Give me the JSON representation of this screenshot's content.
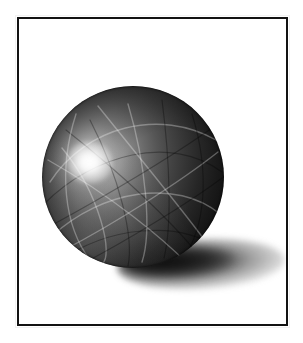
{
  "artwork": {
    "title": "Shaded sphere illustration",
    "subject": "sphere",
    "medium": "grayscale airbrush / digital render",
    "background_color": "#ffffff",
    "canvas": {
      "width": 303,
      "height": 343
    }
  },
  "frame": {
    "name": "rectangular border",
    "color": "#121212",
    "thickness_px": 2,
    "x": 17,
    "y": 17,
    "width": 271,
    "height": 309,
    "fill": "#ffffff"
  },
  "sphere": {
    "label": "sphere",
    "center_x": 133,
    "center_y": 177,
    "radius": 91,
    "highlight_x": 80,
    "highlight_y": 155,
    "highlight_color": "#ffffff",
    "midtone_color": "#6a6a6a",
    "shadow_color": "#080808",
    "surface_texture": "intersecting engraved arc grooves",
    "groove_light_color": "#ffffff",
    "groove_dark_color": "#000000",
    "light_direction": "upper-left",
    "grooves": [
      {
        "d": "M 8 96 C 44 40, 118 22, 174 54",
        "tone": "light"
      },
      {
        "d": "M 2 118 C 52 68, 128 48, 180 86",
        "tone": "dark"
      },
      {
        "d": "M 10 150 C 60 104, 134 92, 178 128",
        "tone": "light"
      },
      {
        "d": "M 16 176 C 66 140, 136 134, 176 162",
        "tone": "dark"
      },
      {
        "d": "M 20 62 C 58 108, 72 170, 60 178",
        "tone": "light"
      },
      {
        "d": "M 48 34 C 78 92, 92 152, 86 180",
        "tone": "dark"
      },
      {
        "d": "M 86 18 C 104 78, 110 146, 100 176",
        "tone": "light"
      },
      {
        "d": "M 120 14 C 128 76, 130 140, 122 172",
        "tone": "dark"
      },
      {
        "d": "M 6 74 C 70 110, 120 152, 146 178",
        "tone": "light"
      },
      {
        "d": "M 24 44 C 80 88, 128 134, 156 168",
        "tone": "dark"
      },
      {
        "d": "M 56 20 C 96 70, 136 118, 164 156",
        "tone": "light"
      },
      {
        "d": "M 12 138 C 60 112, 128 72, 170 42",
        "tone": "dark"
      },
      {
        "d": "M 22 164 C 72 138, 138 96, 176 66",
        "tone": "light"
      },
      {
        "d": "M 40 178 C 86 154, 148 116, 180 92",
        "tone": "dark"
      },
      {
        "d": "M 34 28 C 16 84, 22 140, 48 174",
        "tone": "light"
      },
      {
        "d": "M 150 28 C 168 86, 164 142, 140 174",
        "tone": "dark"
      }
    ]
  },
  "cast_shadow": {
    "label": "cast shadow",
    "color": "#1a1a1a",
    "x": 117,
    "y": 239,
    "width": 168,
    "height": 50,
    "direction": "lower-right",
    "softness": "soft blurred ellipse"
  }
}
